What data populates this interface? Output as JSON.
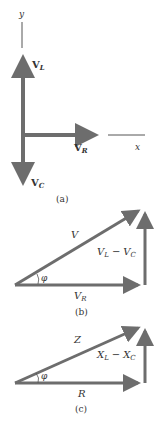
{
  "colors": {
    "arrow": "#6d6d6d",
    "axis": "#555555",
    "text": "#333333",
    "background": "#ffffff"
  },
  "panel_a": {
    "caption": "(a)",
    "axis_y_label": "y",
    "axis_x_label": "x",
    "vectors": [
      {
        "name": "V",
        "sub": "L",
        "direction": "up"
      },
      {
        "name": "V",
        "sub": "R",
        "direction": "right"
      },
      {
        "name": "V",
        "sub": "C",
        "direction": "down"
      }
    ]
  },
  "panel_b": {
    "caption": "(b)",
    "hypotenuse": "V",
    "base_name": "V",
    "base_sub": "R",
    "vertical_a": "V",
    "vertical_a_sub": "L",
    "minus": "−",
    "vertical_b": "V",
    "vertical_b_sub": "C",
    "angle": "φ"
  },
  "panel_c": {
    "caption": "(c)",
    "hypotenuse": "Z",
    "base": "R",
    "vertical_a": "X",
    "vertical_a_sub": "L",
    "minus": "−",
    "vertical_b": "X",
    "vertical_b_sub": "C",
    "angle": "φ"
  }
}
